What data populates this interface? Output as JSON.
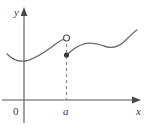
{
  "figure": {
    "width": 148,
    "height": 127,
    "background_color": "#ffffff"
  },
  "axes": {
    "x_axis": {
      "label": "x",
      "name": "x-axis",
      "color": "#555555",
      "y_pixel": 100,
      "x_start": 2,
      "x_end": 141,
      "arrow": "right"
    },
    "y_axis": {
      "label": "y",
      "name": "y-axis",
      "color": "#555555",
      "x_pixel": 24,
      "y_top": 8,
      "y_bottom": 123,
      "arrow": "up"
    },
    "origin": {
      "label": "0",
      "x_pixel": 16,
      "y_pixel": 111
    }
  },
  "ticks": {
    "x": [
      {
        "label": "a",
        "x_pixel": 67,
        "label_y_pixel": 113
      }
    ]
  },
  "curve": {
    "name": "function-curve",
    "color": "#6b6b6b",
    "stroke_width": 1.3,
    "left_branch_path": "M 7,54 C 13,60 18,62 25,61 C 36,59 48,50 57,43 C 61,40 64,39 66,38.5",
    "right_branch_path": "M 67,55 C 72,50 78,45 85,43.5 C 93,42 101,45 107,47 C 114,48.5 120,46 126,40 C 131,35 134,32 137,30",
    "left_branch_start": [
      7,
      54
    ],
    "left_branch_min": [
      25,
      61
    ],
    "right_branch_local_max": [
      86,
      43
    ],
    "right_branch_local_min": [
      107,
      47
    ],
    "right_branch_end": [
      137,
      30
    ]
  },
  "discontinuity": {
    "x_value_label": "a",
    "open_circle": {
      "name": "open-circle-limit-value",
      "cx": 66.5,
      "cy": 38,
      "r": 3.0,
      "fill": "#ffffff",
      "stroke": "#5a5a5a",
      "stroke_width": 1.2,
      "meaning": "limit value (not attained)"
    },
    "filled_dot": {
      "name": "filled-dot-function-value",
      "cx": 66.5,
      "cy": 55,
      "r": 2.6,
      "fill": "#3c3c3c",
      "meaning": "actual function value f(a)"
    },
    "dashed_line": {
      "name": "dashed-vertical-line",
      "x": 66.5,
      "y_top": 38,
      "y_bottom": 100,
      "color": "#8a8a8a",
      "stroke_width": 1.2,
      "dash_pattern": "3,3"
    }
  },
  "colors": {
    "curve": "#6b6b6b",
    "axis": "#555555",
    "text": "#3a3a3a",
    "dash": "#8a8a8a",
    "dot_fill": "#3c3c3c",
    "circle_fill": "#ffffff"
  }
}
